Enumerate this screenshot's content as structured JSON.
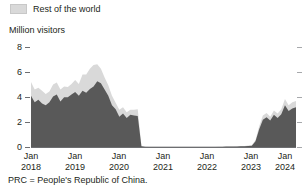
{
  "legend": {
    "items": [
      {
        "label": "Rest of the world",
        "color": "#d9d9d9"
      }
    ]
  },
  "axis": {
    "ylabel": "Million visitors",
    "yticks": [
      "0",
      "2",
      "4",
      "6",
      "8"
    ],
    "xticks": [
      {
        "month": "Jan",
        "year": "2018"
      },
      {
        "month": "Jan",
        "year": "2019"
      },
      {
        "month": "Jan",
        "year": "2020"
      },
      {
        "month": "Jan",
        "year": "2021"
      },
      {
        "month": "Jan",
        "year": "2022"
      },
      {
        "month": "Jan",
        "year": "2023"
      },
      {
        "month": "Jan",
        "year": "2024"
      }
    ]
  },
  "footnote": "PRC = People's Republic of China.",
  "chart_data": {
    "type": "area",
    "stacked": true,
    "title": "",
    "xlabel": "",
    "ylabel": "Million visitors",
    "ylim": [
      0,
      8
    ],
    "yticks": [
      0,
      2,
      4,
      6,
      8
    ],
    "grid": false,
    "legend_position": "top-left",
    "colors": {
      "prc": "#595959",
      "rest_of_world": "#d9d9d9"
    },
    "x": [
      "Jan 2018",
      "Feb 2018",
      "Mar 2018",
      "Apr 2018",
      "May 2018",
      "Jun 2018",
      "Jul 2018",
      "Aug 2018",
      "Sep 2018",
      "Oct 2018",
      "Nov 2018",
      "Dec 2018",
      "Jan 2019",
      "Feb 2019",
      "Mar 2019",
      "Apr 2019",
      "May 2019",
      "Jun 2019",
      "Jul 2019",
      "Aug 2019",
      "Sep 2019",
      "Oct 2019",
      "Nov 2019",
      "Dec 2019",
      "Jan 2020",
      "Feb 2020",
      "Mar 2020",
      "Apr 2020",
      "May 2020",
      "Jun 2020",
      "Jul 2020",
      "Aug 2020",
      "Sep 2020",
      "Oct 2020",
      "Nov 2020",
      "Dec 2020",
      "Jan 2021",
      "Feb 2021",
      "Mar 2021",
      "Apr 2021",
      "May 2021",
      "Jun 2021",
      "Jul 2021",
      "Aug 2021",
      "Sep 2021",
      "Oct 2021",
      "Nov 2021",
      "Dec 2021",
      "Jan 2022",
      "Feb 2022",
      "Mar 2022",
      "Apr 2022",
      "May 2022",
      "Jun 2022",
      "Jul 2022",
      "Aug 2022",
      "Sep 2022",
      "Oct 2022",
      "Nov 2022",
      "Dec 2022",
      "Jan 2023",
      "Feb 2023",
      "Mar 2023",
      "Apr 2023",
      "May 2023",
      "Jun 2023",
      "Jul 2023",
      "Aug 2023",
      "Sep 2023",
      "Oct 2023",
      "Nov 2023",
      "Dec 2023",
      "Jan 2024"
    ],
    "series": [
      {
        "name": "PRC",
        "color": "#595959",
        "values": [
          4.05,
          3.55,
          3.75,
          3.45,
          3.3,
          3.55,
          4.0,
          4.15,
          3.6,
          3.95,
          3.95,
          4.15,
          4.35,
          4.05,
          4.45,
          4.3,
          4.6,
          4.8,
          5.2,
          5.05,
          4.55,
          4.05,
          3.3,
          3.0,
          2.4,
          2.65,
          2.3,
          2.55,
          2.5,
          2.45,
          0.05,
          0.02,
          0.01,
          0.01,
          0.01,
          0.01,
          0.01,
          0.01,
          0.01,
          0.01,
          0.01,
          0.01,
          0.01,
          0.01,
          0.01,
          0.01,
          0.01,
          0.01,
          0.01,
          0.01,
          0.01,
          0.02,
          0.02,
          0.03,
          0.03,
          0.03,
          0.04,
          0.05,
          0.06,
          0.08,
          0.1,
          0.45,
          1.4,
          2.15,
          2.35,
          2.1,
          2.55,
          2.3,
          2.6,
          3.3,
          2.85,
          3.05,
          3.15
        ]
      },
      {
        "name": "Rest of the world",
        "color": "#d9d9d9",
        "values": [
          1.1,
          1.0,
          0.95,
          1.0,
          0.9,
          0.85,
          0.95,
          0.95,
          0.95,
          0.85,
          0.8,
          0.85,
          0.95,
          0.95,
          1.3,
          1.45,
          1.6,
          1.7,
          1.35,
          1.15,
          0.95,
          0.85,
          0.75,
          0.5,
          0.55,
          0.5,
          0.45,
          0.4,
          0.45,
          0.55,
          0.02,
          0.01,
          0.01,
          0.01,
          0.01,
          0.01,
          0.01,
          0.01,
          0.01,
          0.01,
          0.01,
          0.01,
          0.01,
          0.01,
          0.01,
          0.01,
          0.01,
          0.01,
          0.01,
          0.01,
          0.01,
          0.01,
          0.01,
          0.01,
          0.01,
          0.01,
          0.01,
          0.02,
          0.02,
          0.03,
          0.03,
          0.1,
          0.25,
          0.35,
          0.35,
          0.3,
          0.35,
          0.35,
          0.4,
          0.5,
          0.45,
          0.5,
          0.5
        ]
      }
    ]
  }
}
